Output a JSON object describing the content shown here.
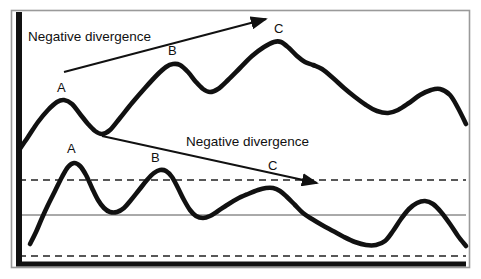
{
  "figure": {
    "background_color": "#ffffff",
    "border_color": "#9a9a9a",
    "ink_color": "#111111"
  },
  "annotations": {
    "upper_divergence_label": "Negative divergence",
    "lower_divergence_label": "Negative divergence"
  },
  "labels": {
    "price_peak_a": "A",
    "price_peak_b": "B",
    "price_peak_c": "C",
    "osc_peak_a": "A",
    "osc_peak_b": "B",
    "osc_peak_c": "C"
  },
  "chart_data": {
    "type": "line",
    "title": "Negative divergence",
    "xlabel": "",
    "ylabel": "",
    "grid": false,
    "legend_position": "none",
    "xlim": [
      0,
      481
    ],
    "ylim": [
      279,
      0
    ],
    "axes": {
      "y_axis_x": 19,
      "x_axis_y": 264,
      "frame": {
        "x": 11,
        "y": 10,
        "width": 459,
        "height": 258
      }
    },
    "reference_lines": [
      {
        "name": "overbought",
        "style": "dashed",
        "y": 180,
        "x_start": 19,
        "x_end": 466
      },
      {
        "name": "midline",
        "style": "solid",
        "y": 215,
        "x_start": 19,
        "x_end": 466
      },
      {
        "name": "oversold",
        "style": "dashed",
        "y": 256,
        "x_start": 19,
        "x_end": 466
      }
    ],
    "series": [
      {
        "name": "price",
        "style": "thick-solid",
        "peaks": [
          {
            "label": "A",
            "x": 62,
            "y": 100
          },
          {
            "label": "B",
            "x": 172,
            "y": 65
          },
          {
            "label": "C",
            "x": 279,
            "y": 42
          }
        ],
        "points": [
          [
            19,
            150
          ],
          [
            28,
            137
          ],
          [
            38,
            122
          ],
          [
            48,
            110
          ],
          [
            57,
            102
          ],
          [
            64,
            100
          ],
          [
            72,
            104
          ],
          [
            80,
            114
          ],
          [
            88,
            124
          ],
          [
            95,
            131
          ],
          [
            102,
            134
          ],
          [
            110,
            130
          ],
          [
            120,
            118
          ],
          [
            132,
            103
          ],
          [
            145,
            88
          ],
          [
            157,
            75
          ],
          [
            166,
            67
          ],
          [
            173,
            64
          ],
          [
            180,
            65
          ],
          [
            188,
            72
          ],
          [
            196,
            82
          ],
          [
            203,
            89
          ],
          [
            210,
            92
          ],
          [
            218,
            89
          ],
          [
            228,
            80
          ],
          [
            240,
            68
          ],
          [
            252,
            56
          ],
          [
            264,
            47
          ],
          [
            274,
            42
          ],
          [
            281,
            42
          ],
          [
            289,
            48
          ],
          [
            297,
            56
          ],
          [
            305,
            62
          ],
          [
            313,
            65
          ],
          [
            322,
            69
          ],
          [
            333,
            78
          ],
          [
            344,
            88
          ],
          [
            355,
            97
          ],
          [
            366,
            105
          ],
          [
            377,
            111
          ],
          [
            388,
            113
          ],
          [
            398,
            110
          ],
          [
            409,
            103
          ],
          [
            420,
            95
          ],
          [
            431,
            90
          ],
          [
            440,
            89
          ],
          [
            450,
            95
          ],
          [
            458,
            108
          ],
          [
            466,
            124
          ]
        ]
      },
      {
        "name": "oscillator",
        "style": "thick-solid",
        "peaks": [
          {
            "label": "A",
            "x": 72,
            "y": 163
          },
          {
            "label": "B",
            "x": 158,
            "y": 170
          },
          {
            "label": "C",
            "x": 272,
            "y": 188
          }
        ],
        "points": [
          [
            30,
            244
          ],
          [
            36,
            232
          ],
          [
            42,
            218
          ],
          [
            48,
            205
          ],
          [
            55,
            191
          ],
          [
            62,
            177
          ],
          [
            68,
            167
          ],
          [
            74,
            163
          ],
          [
            80,
            166
          ],
          [
            86,
            175
          ],
          [
            92,
            188
          ],
          [
            98,
            200
          ],
          [
            104,
            208
          ],
          [
            110,
            212
          ],
          [
            117,
            212
          ],
          [
            124,
            208
          ],
          [
            131,
            200
          ],
          [
            139,
            190
          ],
          [
            147,
            180
          ],
          [
            154,
            173
          ],
          [
            160,
            170
          ],
          [
            166,
            171
          ],
          [
            172,
            177
          ],
          [
            178,
            188
          ],
          [
            184,
            200
          ],
          [
            190,
            210
          ],
          [
            196,
            216
          ],
          [
            203,
            218
          ],
          [
            210,
            216
          ],
          [
            218,
            211
          ],
          [
            227,
            205
          ],
          [
            237,
            199
          ],
          [
            248,
            194
          ],
          [
            258,
            190
          ],
          [
            266,
            188
          ],
          [
            273,
            188
          ],
          [
            280,
            191
          ],
          [
            287,
            197
          ],
          [
            295,
            205
          ],
          [
            303,
            213
          ],
          [
            312,
            219
          ],
          [
            322,
            225
          ],
          [
            333,
            231
          ],
          [
            344,
            237
          ],
          [
            355,
            242
          ],
          [
            366,
            245
          ],
          [
            376,
            245
          ],
          [
            385,
            241
          ],
          [
            393,
            231
          ],
          [
            401,
            219
          ],
          [
            409,
            209
          ],
          [
            417,
            203
          ],
          [
            425,
            201
          ],
          [
            433,
            204
          ],
          [
            441,
            212
          ],
          [
            450,
            224
          ],
          [
            458,
            236
          ],
          [
            466,
            246
          ]
        ]
      }
    ],
    "trendlines": [
      {
        "name": "price-trendline-rising",
        "arrow": true,
        "x1": 64,
        "y1": 72,
        "x2": 266,
        "y2": 19,
        "direction": "up"
      },
      {
        "name": "oscillator-trendline-falling",
        "arrow": true,
        "x1": 102,
        "y1": 136,
        "x2": 317,
        "y2": 183,
        "direction": "down"
      }
    ],
    "text_annotations": [
      {
        "text": "Negative divergence",
        "x": 28,
        "y": 41
      },
      {
        "text": "Negative divergence",
        "x": 186,
        "y": 146
      }
    ],
    "point_labels": [
      {
        "text": "A",
        "x": 57,
        "y": 92
      },
      {
        "text": "B",
        "x": 168,
        "y": 55
      },
      {
        "text": "C",
        "x": 274,
        "y": 33
      },
      {
        "text": "A",
        "x": 67,
        "y": 153
      },
      {
        "text": "B",
        "x": 151,
        "y": 162
      },
      {
        "text": "C",
        "x": 268,
        "y": 170
      }
    ]
  }
}
